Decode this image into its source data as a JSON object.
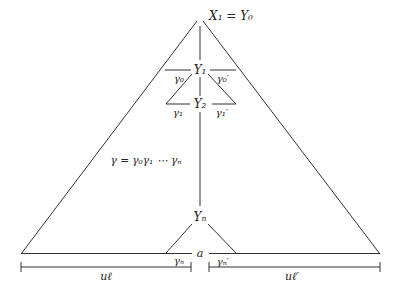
{
  "diagram": {
    "labels": {
      "apex": "X₁ = Y₀",
      "y1": "Y₁",
      "y2": "Y₂",
      "yn": "Yₙ",
      "gamma0": "γ₀",
      "gamma0_prime": "γ₀′",
      "gamma1": "γ₁",
      "gamma1_prime": "γ₁′",
      "gamma_n": "γₙ",
      "gamma_n_prime": "γₙ′",
      "gamma_product": "γ = γ₀γ₁ ⋯ γₙ",
      "base_point": "a",
      "u_left": "uℓ",
      "u_right": "uℓ′"
    },
    "colors": {
      "stroke": "#333333",
      "text": "#222222",
      "background": "#ffffff"
    }
  }
}
